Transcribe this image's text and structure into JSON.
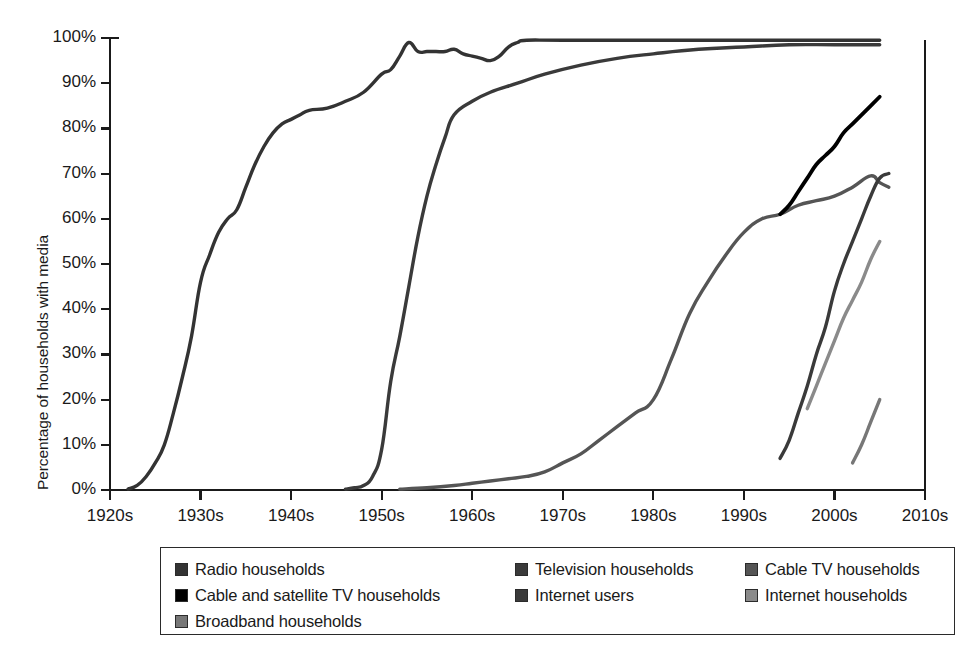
{
  "axes": {
    "ylabel": "Percentage of households with media",
    "yticks": [
      "0%",
      "10%",
      "20%",
      "30%",
      "40%",
      "50%",
      "60%",
      "70%",
      "80%",
      "90%",
      "100%"
    ],
    "xticks": [
      "1920s",
      "1930s",
      "1940s",
      "1950s",
      "1960s",
      "1970s",
      "1980s",
      "1990s",
      "2000s",
      "2010s"
    ]
  },
  "legend": {
    "entries": [
      {
        "label": "Radio households",
        "color": "#333333"
      },
      {
        "label": "Television households",
        "color": "#3a3a3a"
      },
      {
        "label": "Cable TV households",
        "color": "#555555"
      },
      {
        "label": "Cable and satellite TV households",
        "color": "#000000"
      },
      {
        "label": "Internet users",
        "color": "#3a3a3a"
      },
      {
        "label": "Internet households",
        "color": "#8a8a8a"
      },
      {
        "label": "Broadband households",
        "color": "#777777"
      }
    ]
  },
  "chart_data": {
    "type": "line",
    "title": "",
    "xlabel": "",
    "ylabel": "Percentage of households with media",
    "xlim": [
      1920,
      2010
    ],
    "ylim": [
      0,
      100
    ],
    "grid": false,
    "legend_position": "bottom",
    "xtick_values": [
      1920,
      1930,
      1940,
      1950,
      1960,
      1970,
      1980,
      1990,
      2000,
      2010
    ],
    "ytick_values": [
      0,
      10,
      20,
      30,
      40,
      50,
      60,
      70,
      80,
      90,
      100
    ],
    "series": [
      {
        "name": "Radio households",
        "color": "#333333",
        "width": 3.4,
        "x": [
          1922,
          1923,
          1924,
          1925,
          1926,
          1927,
          1928,
          1929,
          1930,
          1931,
          1932,
          1933,
          1934,
          1935,
          1936,
          1937,
          1938,
          1939,
          1940,
          1941,
          1942,
          1944,
          1946,
          1948,
          1950,
          1951,
          1952,
          1953,
          1954,
          1955,
          1956,
          1957,
          1958,
          1959,
          1960,
          1961,
          1962,
          1963,
          1964,
          1965,
          1966,
          1970,
          1980,
          1990,
          2000,
          2005
        ],
        "y": [
          0.2,
          1,
          3,
          6,
          10,
          17,
          25,
          34,
          46,
          52,
          57,
          60,
          62,
          67,
          72,
          76,
          79,
          81,
          82,
          83,
          84,
          84.5,
          86,
          88,
          92,
          93,
          96,
          99,
          97,
          97,
          97,
          97,
          97.5,
          96.5,
          96,
          95.5,
          95,
          96,
          98,
          99,
          99.5,
          99.5,
          99.5,
          99.5,
          99.5,
          99.5
        ]
      },
      {
        "name": "Television households",
        "color": "#3a3a3a",
        "width": 3.4,
        "x": [
          1946,
          1947,
          1948,
          1949,
          1950,
          1951,
          1952,
          1953,
          1954,
          1955,
          1956,
          1957,
          1958,
          1960,
          1962,
          1965,
          1968,
          1972,
          1976,
          1980,
          1985,
          1990,
          1995,
          2000,
          2005
        ],
        "y": [
          0.2,
          0.5,
          1,
          3,
          9,
          24,
          34,
          45,
          56,
          65,
          72,
          78,
          83,
          86,
          88,
          90,
          92,
          94,
          95.5,
          96.5,
          97.5,
          98,
          98.5,
          98.5,
          98.5
        ]
      },
      {
        "name": "Cable TV households",
        "color": "#555555",
        "width": 3.4,
        "x": [
          1952,
          1955,
          1958,
          1960,
          1962,
          1964,
          1966,
          1968,
          1970,
          1972,
          1974,
          1976,
          1978,
          1980,
          1982,
          1984,
          1986,
          1988,
          1990,
          1992,
          1994,
          1996,
          1998,
          2000,
          2002,
          2004,
          2005,
          2006
        ],
        "y": [
          0.2,
          0.5,
          1,
          1.5,
          2,
          2.5,
          3,
          4,
          6,
          8,
          11,
          14,
          17,
          20,
          29,
          39,
          46,
          52,
          57,
          60,
          61,
          63,
          64,
          65,
          67,
          69.5,
          68,
          67
        ]
      },
      {
        "name": "Cable and satellite TV households",
        "color": "#000000",
        "width": 3.8,
        "x": [
          1994,
          1995,
          1996,
          1997,
          1998,
          1999,
          2000,
          2001,
          2002,
          2003,
          2004,
          2005
        ],
        "y": [
          61,
          63,
          66,
          69,
          72,
          74,
          76,
          79,
          81,
          83,
          85,
          87
        ]
      },
      {
        "name": "Internet users",
        "color": "#3a3a3a",
        "width": 3.4,
        "x": [
          1994,
          1995,
          1996,
          1997,
          1998,
          1999,
          2000,
          2001,
          2002,
          2003,
          2004,
          2005,
          2006
        ],
        "y": [
          7,
          11,
          17,
          23,
          30,
          36,
          44,
          50,
          55,
          60,
          65,
          69,
          70
        ]
      },
      {
        "name": "Internet households",
        "color": "#8a8a8a",
        "width": 3.4,
        "x": [
          1997,
          1998,
          1999,
          2000,
          2001,
          2002,
          2003,
          2004,
          2005
        ],
        "y": [
          18,
          23,
          28,
          33,
          38,
          42,
          46,
          51,
          55
        ]
      },
      {
        "name": "Broadband households",
        "color": "#777777",
        "width": 3.4,
        "x": [
          2002,
          2003,
          2004,
          2005
        ],
        "y": [
          6,
          10,
          15,
          20
        ]
      }
    ]
  }
}
